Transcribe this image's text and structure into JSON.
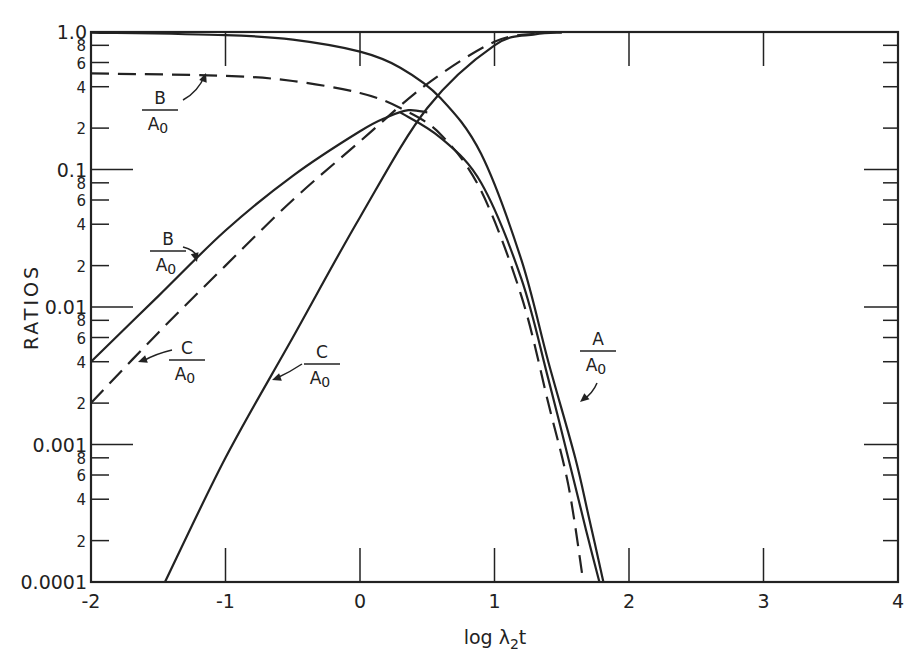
{
  "chart_data": {
    "type": "line",
    "title": "",
    "xlabel": "log λ2t",
    "ylabel": "RATIOS",
    "xscale": "linear",
    "yscale": "log",
    "xlim": [
      -2,
      4
    ],
    "ylim": [
      0.0001,
      1.0
    ],
    "grid": false,
    "legend": "none (inline annotations)",
    "x_ticks": [
      "-2",
      "-1",
      "0",
      "1",
      "2",
      "3",
      "4"
    ],
    "y_ticks": [
      "0.0001",
      "2",
      "4",
      "6",
      "8",
      "0.001",
      "2",
      "4",
      "6",
      "8",
      "0.01",
      "2",
      "4",
      "6",
      "8",
      "0.1",
      "2",
      "4",
      "6",
      "8",
      "1.0"
    ],
    "annotations": [
      {
        "label_num": "B",
        "label_den": "A0",
        "target": "dashed B/A0 (upper plateau)",
        "x": -1.5,
        "y": 0.3
      },
      {
        "label_num": "B",
        "label_den": "A0",
        "target": "solid B/A0 (rising)",
        "x": -1.35,
        "y": 0.02
      },
      {
        "label_num": "C",
        "label_den": "A0",
        "target": "dashed C/A0",
        "x": -1.4,
        "y": 0.0045
      },
      {
        "label_num": "C",
        "label_den": "A0",
        "target": "solid C/A0",
        "x": -0.75,
        "y": 0.0035
      },
      {
        "label_num": "A",
        "label_den": "A0",
        "target": "solid A/A0",
        "x": 1.65,
        "y": 0.004
      }
    ],
    "series": [
      {
        "name": "A/A0 (solid, outer)",
        "style": "solid",
        "x": [
          -2,
          -1,
          -0.5,
          0,
          0.3,
          0.6,
          0.9,
          1.2,
          1.4,
          1.6,
          1.7,
          1.81
        ],
        "y": [
          0.99,
          0.95,
          0.88,
          0.72,
          0.55,
          0.33,
          0.13,
          0.022,
          0.004,
          0.0008,
          0.0003,
          0.0001
        ]
      },
      {
        "name": "A/A0 (solid, inner)",
        "style": "solid",
        "x": [
          0.3,
          0.6,
          0.9,
          1.2,
          1.4,
          1.6,
          1.7,
          1.78
        ],
        "y": [
          0.26,
          0.17,
          0.08,
          0.016,
          0.003,
          0.0005,
          0.0002,
          0.0001
        ]
      },
      {
        "name": "B/A0 (dashed)",
        "style": "dashed",
        "x": [
          -2,
          -1,
          -0.5,
          0,
          0.3,
          0.6,
          0.9,
          1.2,
          1.4,
          1.55,
          1.66
        ],
        "y": [
          0.5,
          0.48,
          0.44,
          0.36,
          0.28,
          0.18,
          0.07,
          0.012,
          0.002,
          0.0005,
          0.0001
        ]
      },
      {
        "name": "B/A0 (solid)",
        "style": "solid",
        "x": [
          -2,
          -1.5,
          -1,
          -0.5,
          0,
          0.2,
          0.36,
          0.5
        ],
        "y": [
          0.004,
          0.012,
          0.036,
          0.09,
          0.19,
          0.24,
          0.27,
          0.26
        ]
      },
      {
        "name": "C/A0 (dashed)",
        "style": "dashed",
        "x": [
          -2,
          -1.5,
          -1,
          -0.5,
          0,
          0.5,
          1,
          1.3
        ],
        "y": [
          0.002,
          0.0065,
          0.02,
          0.06,
          0.16,
          0.42,
          0.85,
          0.97
        ]
      },
      {
        "name": "C/A0 (solid)",
        "style": "solid",
        "x": [
          -1.45,
          -1,
          -0.5,
          0,
          0.5,
          1,
          1.3,
          1.5
        ],
        "y": [
          0.0001,
          0.0008,
          0.006,
          0.045,
          0.28,
          0.8,
          0.96,
          0.99
        ]
      }
    ]
  },
  "axes": {
    "x_title": "log λ",
    "x_title_sub": "2",
    "x_title_tail": "t",
    "y_title": "RATIOS",
    "x_tick_labels": [
      "-2",
      "-1",
      "0",
      "1",
      "2",
      "3",
      "4"
    ],
    "y_major_labels": [
      "1.0",
      "0.1",
      "0.01",
      "0.001",
      "0.0001"
    ],
    "y_minor_labels": [
      "8",
      "6",
      "4",
      "2"
    ]
  },
  "annotations": {
    "b_dashed": {
      "num": "B",
      "den": "A",
      "sub": "0"
    },
    "b_solid": {
      "num": "B",
      "den": "A",
      "sub": "0"
    },
    "c_dashed": {
      "num": "C",
      "den": "A",
      "sub": "0"
    },
    "c_solid": {
      "num": "C",
      "den": "A",
      "sub": "0"
    },
    "a_solid": {
      "num": "A",
      "den": "A",
      "sub": "0"
    }
  },
  "colors": {
    "ink": "#222222",
    "background": "#ffffff"
  }
}
